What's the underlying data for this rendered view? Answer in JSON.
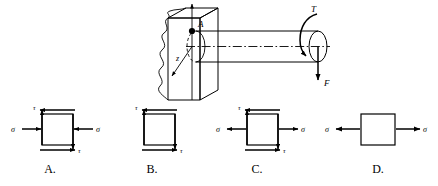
{
  "figure": {
    "title_text": "",
    "background_color": "#ffffff",
    "line_color": "#000000"
  },
  "shaft_diagram": {
    "name": "cantilever-shaft-with-torque-and-force",
    "point_label": "A",
    "axis_label_z": "z",
    "torque_label": "T",
    "force_label": "F",
    "wall_description": "fixed support wall with broken-section edges",
    "shaft_description": "horizontal circular cylindrical shaft cantilevered from wall",
    "centerline_style": "dash-dot"
  },
  "options": [
    {
      "key": "A",
      "label": "A.",
      "normal_stress_label": "σ",
      "shear_stress_label": "τ",
      "has_normal_stress": true,
      "normal_stress_sense": "compression",
      "has_shear_stress": true,
      "left_normal_label": "σ",
      "right_normal_label": "σ",
      "top_shear_label": "τ",
      "bottom_shear_label": "τ"
    },
    {
      "key": "B",
      "label": "B.",
      "normal_stress_label": "σ",
      "shear_stress_label": "τ",
      "has_normal_stress": false,
      "normal_stress_sense": "none",
      "has_shear_stress": true,
      "left_normal_label": "",
      "right_normal_label": "",
      "top_shear_label": "τ",
      "bottom_shear_label": "τ"
    },
    {
      "key": "C",
      "label": "C.",
      "normal_stress_label": "σ",
      "shear_stress_label": "τ",
      "has_normal_stress": true,
      "normal_stress_sense": "tension",
      "has_shear_stress": true,
      "left_normal_label": "σ",
      "right_normal_label": "σ",
      "top_shear_label": "τ",
      "bottom_shear_label": "τ"
    },
    {
      "key": "D",
      "label": "D.",
      "normal_stress_label": "σ",
      "shear_stress_label": "",
      "has_normal_stress": true,
      "normal_stress_sense": "tension",
      "has_shear_stress": false,
      "left_normal_label": "σ",
      "right_normal_label": "σ",
      "top_shear_label": "",
      "bottom_shear_label": ""
    }
  ]
}
